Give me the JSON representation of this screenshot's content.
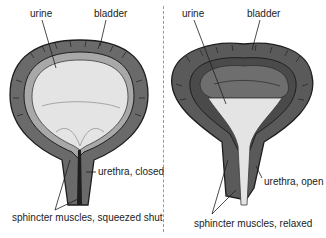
{
  "diagram": {
    "title": "",
    "colors": {
      "wall_dark": "#4a4a4a",
      "wall_mid": "#7d7d7d",
      "wall_light": "#a8a8a8",
      "urine_fill": "#e4e4e4",
      "outline": "#1e1e1e",
      "divider": "#9a9a9a",
      "text": "#222222"
    },
    "panels": [
      {
        "state": "closed",
        "labels": {
          "urine": "urine",
          "bladder": "bladder",
          "urethra": "urethra, closed",
          "sphincter": "sphincter muscles, squeezed shut"
        }
      },
      {
        "state": "open",
        "labels": {
          "urine": "urine",
          "bladder": "bladder",
          "urethra": "urethra, open",
          "sphincter": "sphincter muscles, relaxed"
        }
      }
    ]
  }
}
